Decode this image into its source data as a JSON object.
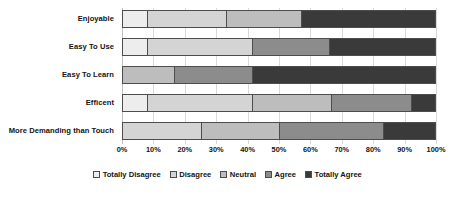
{
  "chart_data": {
    "type": "bar",
    "subtype": "stacked-horizontal-100",
    "title": "",
    "xlabel": "",
    "ylabel": "",
    "xlim": [
      0,
      100
    ],
    "grid": true,
    "legend_position": "bottom",
    "categories": [
      "Enjoyable",
      "Easy To Use",
      "Easy To Learn",
      "Efficent",
      "More Demanding than Touch"
    ],
    "tick_labels": [
      "0%",
      "10%",
      "20%",
      "30%",
      "40%",
      "50%",
      "60%",
      "70%",
      "80%",
      "90%",
      "100%"
    ],
    "tick_values": [
      0,
      10,
      20,
      30,
      40,
      50,
      60,
      70,
      80,
      90,
      100
    ],
    "series": [
      {
        "name": "Totally Disagree",
        "color": "#ededed",
        "values": [
          8,
          8,
          0,
          8,
          0
        ]
      },
      {
        "name": "Disagree",
        "color": "#d4d4d4",
        "values": [
          25,
          33.5,
          0,
          33.5,
          25
        ]
      },
      {
        "name": "Neutral",
        "color": "#bdbdbd",
        "values": [
          24,
          0,
          16.5,
          25,
          25
        ]
      },
      {
        "name": "Agree",
        "color": "#8c8c8c",
        "values": [
          0,
          24.5,
          25,
          25.5,
          33
        ]
      },
      {
        "name": "Totally Agree",
        "color": "#3a3a3a",
        "values": [
          43,
          34,
          58.5,
          8,
          17
        ]
      }
    ]
  }
}
